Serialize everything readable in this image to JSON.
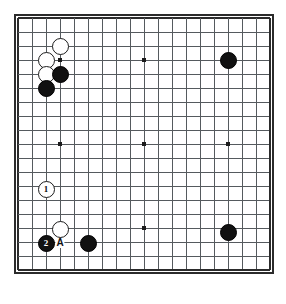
{
  "figure": {
    "kind": "go-board-diagram",
    "board_size": 19,
    "background_color": "#ffffff",
    "line_color": "#555a5e",
    "border_color": "#2b2b2b",
    "black_color": "#111111",
    "white_color": "#ffffff"
  },
  "geometry": {
    "origin_x": 18,
    "origin_y": 18,
    "cell": 14,
    "stone_diameter": 17
  },
  "star_points": [
    {
      "col": 4,
      "row": 4,
      "x": 60,
      "y": 60
    },
    {
      "col": 10,
      "row": 4,
      "x": 144,
      "y": 60
    },
    {
      "col": 16,
      "row": 4,
      "x": 228,
      "y": 60
    },
    {
      "col": 4,
      "row": 10,
      "x": 60,
      "y": 144
    },
    {
      "col": 10,
      "row": 10,
      "x": 144,
      "y": 144
    },
    {
      "col": 16,
      "row": 10,
      "x": 228,
      "y": 144
    },
    {
      "col": 4,
      "row": 16,
      "x": 60,
      "y": 228
    },
    {
      "col": 10,
      "row": 16,
      "x": 144,
      "y": 228
    },
    {
      "col": 16,
      "row": 16,
      "x": 228,
      "y": 228
    }
  ],
  "stones": [
    {
      "id": "w-c4r3",
      "color": "white",
      "col": 4,
      "row": 3,
      "x": 60,
      "y": 46,
      "label": ""
    },
    {
      "id": "w-c3r4",
      "color": "white",
      "col": 3,
      "row": 4,
      "x": 46,
      "y": 60,
      "label": ""
    },
    {
      "id": "w-c3r5",
      "color": "white",
      "col": 3,
      "row": 5,
      "x": 46,
      "y": 74,
      "label": ""
    },
    {
      "id": "b-c4r5",
      "color": "black",
      "col": 4,
      "row": 5,
      "x": 60,
      "y": 74,
      "label": ""
    },
    {
      "id": "b-c3r6",
      "color": "black",
      "col": 3,
      "row": 6,
      "x": 46,
      "y": 88,
      "label": ""
    },
    {
      "id": "b-c16r4",
      "color": "black",
      "col": 16,
      "row": 4,
      "x": 228,
      "y": 60,
      "label": ""
    },
    {
      "id": "w-move1",
      "color": "white",
      "col": 3,
      "row": 13,
      "x": 46,
      "y": 189,
      "label": "1"
    },
    {
      "id": "w-c4r16",
      "color": "white",
      "col": 4,
      "row": 16,
      "x": 60,
      "y": 229,
      "label": ""
    },
    {
      "id": "b-move2",
      "color": "black",
      "col": 3,
      "row": 17,
      "x": 46,
      "y": 243,
      "label": "2"
    },
    {
      "id": "b-c6r17",
      "color": "black",
      "col": 6,
      "row": 17,
      "x": 88,
      "y": 243,
      "label": ""
    },
    {
      "id": "b-c16r16",
      "color": "black",
      "col": 16,
      "row": 16,
      "x": 228,
      "y": 232,
      "label": ""
    }
  ],
  "point_markers": [
    {
      "id": "marker-a",
      "text": "A",
      "col": 4,
      "row": 17,
      "x": 60,
      "y": 243
    }
  ]
}
